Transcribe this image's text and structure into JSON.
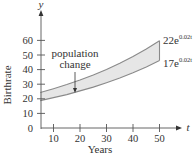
{
  "chart_data": {
    "type": "area",
    "title": "",
    "xlabel": "Years",
    "ylabel": "Birthrate",
    "x_axis_var": "t",
    "y_axis_var": "y",
    "xlim": [
      5,
      55
    ],
    "ylim": [
      0,
      68
    ],
    "x_ticks": [
      10,
      20,
      30,
      40,
      50
    ],
    "y_ticks": [
      0,
      10,
      20,
      30,
      40,
      50,
      60
    ],
    "grid": false,
    "legend": null,
    "series": [
      {
        "name": "22e^(0.02t)",
        "label_main": "22e",
        "label_exp": "0.02t",
        "x": [
          5,
          10,
          15,
          20,
          25,
          30,
          35,
          40,
          45,
          50
        ],
        "values": [
          24.3,
          26.9,
          29.7,
          32.8,
          36.3,
          40.1,
          44.3,
          49.0,
          54.1,
          59.8
        ]
      },
      {
        "name": "17e^(0.02t)",
        "label_main": "17e",
        "label_exp": "0.02t",
        "x": [
          5,
          10,
          15,
          20,
          25,
          30,
          35,
          40,
          45,
          50
        ],
        "values": [
          18.8,
          20.8,
          22.9,
          25.4,
          28.0,
          31.0,
          34.2,
          37.8,
          41.8,
          46.2
        ]
      }
    ],
    "shaded_region": {
      "between": [
        "22e^(0.02t)",
        "17e^(0.02t)"
      ],
      "x_range": [
        5,
        50
      ],
      "fill_color": "#e6e6e6"
    },
    "annotations": [
      {
        "text_line1": "population",
        "text_line2": "change",
        "arrow_to": {
          "t": 18,
          "y": 28
        }
      }
    ],
    "colors": {
      "axis": "#555555",
      "curve": "#8a8a8a",
      "fill": "#e6e6e6",
      "text": "#333333"
    }
  },
  "labels": {
    "y_var": "y",
    "t_var": "t",
    "ylabel": "Birthrate",
    "xlabel": "Years",
    "annot_line1": "population",
    "annot_line2": "change",
    "top_curve_main": "22e",
    "top_curve_exp": "0.02t",
    "bottom_curve_main": "17e",
    "bottom_curve_exp": "0.02t",
    "x_ticks": [
      "10",
      "20",
      "30",
      "40",
      "50"
    ],
    "y_ticks": [
      "0",
      "10",
      "20",
      "30",
      "40",
      "50",
      "60"
    ]
  }
}
